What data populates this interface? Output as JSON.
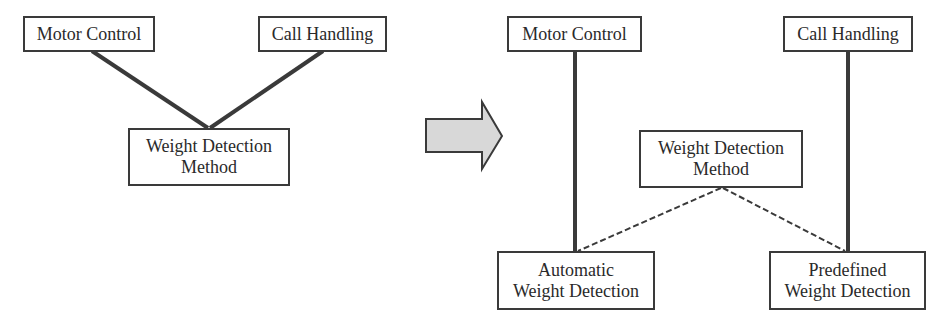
{
  "diagram": {
    "type": "refactoring-transformation",
    "before": {
      "nodes": [
        {
          "id": "motor",
          "lines": [
            "Motor Control"
          ]
        },
        {
          "id": "call",
          "lines": [
            "Call Handling"
          ]
        },
        {
          "id": "wdm",
          "lines": [
            "Weight Detection",
            "Method"
          ]
        }
      ],
      "edges": [
        {
          "from": "motor",
          "to": "wdm",
          "style": "solid-thick"
        },
        {
          "from": "call",
          "to": "wdm",
          "style": "solid-thick"
        }
      ]
    },
    "arrow": {
      "direction": "right",
      "fill": "#d8d8d8"
    },
    "after": {
      "nodes": [
        {
          "id": "motor",
          "lines": [
            "Motor Control"
          ]
        },
        {
          "id": "call",
          "lines": [
            "Call Handling"
          ]
        },
        {
          "id": "wdm",
          "lines": [
            "Weight Detection",
            "Method"
          ]
        },
        {
          "id": "auto",
          "lines": [
            "Automatic",
            "Weight Detection"
          ]
        },
        {
          "id": "predef",
          "lines": [
            "Predefined",
            "Weight Detection"
          ]
        }
      ],
      "edges": [
        {
          "from": "motor",
          "to": "auto",
          "style": "solid-thick"
        },
        {
          "from": "call",
          "to": "predef",
          "style": "solid-thick"
        },
        {
          "from": "wdm",
          "to": "auto",
          "style": "dashed"
        },
        {
          "from": "wdm",
          "to": "predef",
          "style": "dashed"
        }
      ]
    },
    "colors": {
      "line": "#3a3a3a",
      "arrow_fill": "#d8d8d8",
      "arrow_stroke": "#3a3a3a"
    }
  }
}
